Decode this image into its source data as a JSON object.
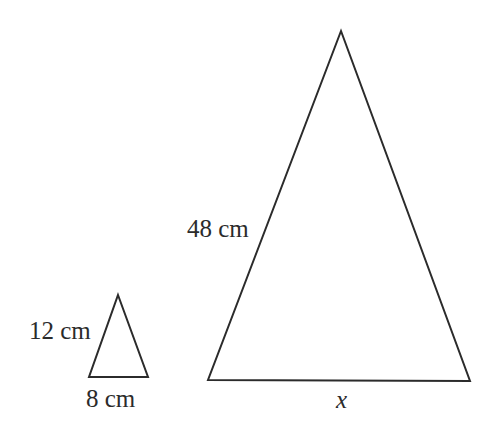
{
  "figure": {
    "background_color": "#ffffff",
    "stroke_color": "#2b2b2b",
    "stroke_width": 2,
    "width": 488,
    "height": 439
  },
  "shapes": {
    "small_triangle": {
      "name": "small-triangle",
      "points": "118,295 148,377 89,377",
      "apex": {
        "x": 118,
        "y": 295
      },
      "base_left": {
        "x": 89,
        "y": 377
      },
      "base_right": {
        "x": 148,
        "y": 377
      }
    },
    "large_triangle": {
      "name": "large-triangle",
      "points": "341,31 470,381 208,380",
      "apex": {
        "x": 341,
        "y": 31
      },
      "base_left": {
        "x": 208,
        "y": 380
      },
      "base_right": {
        "x": 470,
        "y": 381
      }
    }
  },
  "labels": {
    "small_side": "12 cm",
    "small_base": "8 cm",
    "large_side": "48 cm",
    "large_base": "x"
  }
}
